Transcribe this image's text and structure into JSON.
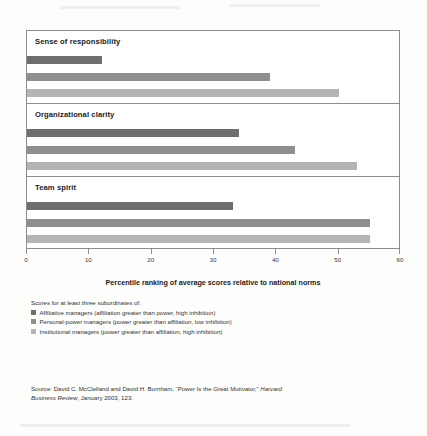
{
  "chart_data": {
    "type": "bar",
    "orientation": "horizontal",
    "title": "",
    "xlabel": "Percentile ranking of average scores relative to national norms",
    "ylabel": "",
    "xlim": [
      0,
      60
    ],
    "xticks": [
      0,
      10,
      20,
      30,
      40,
      50,
      60
    ],
    "grid": false,
    "legend_position": "below",
    "categories": [
      "Sense of responsibility",
      "Organizational clarity",
      "Team spirit"
    ],
    "series": [
      {
        "name": "Affiliative managers (affiliation greater than power, high inhibition)",
        "color": "#6e6e6e",
        "values": [
          12,
          34,
          33
        ]
      },
      {
        "name": "Personal-power managers (power greater than affiliation, low inhibition)",
        "color": "#8f8f8f",
        "values": [
          39,
          43,
          55
        ]
      },
      {
        "name": "Institutional managers (power greater than affiliation, high inhibition)",
        "color": "#b4b4b4",
        "values": [
          50,
          53,
          55
        ]
      }
    ]
  },
  "axis": {
    "title": "Percentile ranking of average scores relative to national norms",
    "tick_labels": [
      "0",
      "10",
      "20",
      "30",
      "40",
      "50",
      "60"
    ]
  },
  "legend": {
    "intro": "Scores for at least three subordinates of:",
    "items": [
      "Affiliative managers (affiliation greater than power, high inhibition)",
      "Personal-power managers (power greater than affiliation, low inhibition)",
      "Institutional managers (power greater than affiliation, high inhibition)"
    ]
  },
  "source": {
    "line1_prefix": "Source:  David C. McClelland and David H. Burnham, “Power Is the Great Motivator,” ",
    "line1_italic": "Harvard",
    "line2_italic": "Business Review",
    "line2_rest": ", January 2003, 123."
  }
}
